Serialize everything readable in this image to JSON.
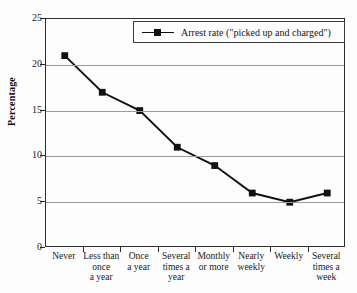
{
  "chart_data": {
    "type": "line",
    "title": "",
    "xlabel": "",
    "ylabel": "Percentage",
    "ylim": [
      0,
      25
    ],
    "ytick_values": [
      0,
      5,
      10,
      15,
      20,
      25
    ],
    "ytick_labels": [
      "0",
      "5",
      "10",
      "15",
      "20",
      "25"
    ],
    "grid": true,
    "legend_position": "top-right",
    "categories": [
      "Never",
      "Less than once a year",
      "Once a year",
      "Several times a year",
      "Monthly or more",
      "Nearly weekly",
      "Weekly",
      "Several times a week"
    ],
    "category_label_lines": [
      [
        "Never"
      ],
      [
        "Less than",
        "once",
        "a year"
      ],
      [
        "Once",
        "a year"
      ],
      [
        "Several",
        "times a",
        "year"
      ],
      [
        "Monthly",
        "or more"
      ],
      [
        "Nearly",
        "weekly"
      ],
      [
        "Weekly"
      ],
      [
        "Several",
        "times a",
        "week"
      ]
    ],
    "series": [
      {
        "name": "Arrest rate (\"picked up and charged\")",
        "values": [
          21,
          17,
          15,
          11,
          9,
          6,
          5,
          6
        ],
        "color": "#111111",
        "marker": "square"
      }
    ]
  },
  "legend": {
    "entries": [
      {
        "label": "Arrest rate (\"picked up and charged\")"
      }
    ]
  }
}
